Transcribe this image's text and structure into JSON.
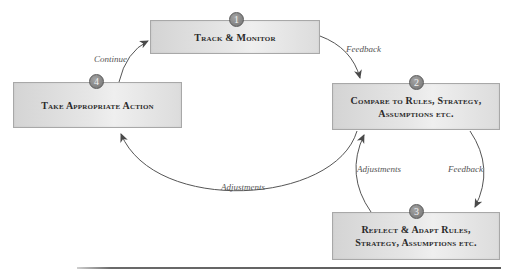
{
  "diagram": {
    "type": "cycle",
    "nodes": [
      {
        "id": 1,
        "number": "1",
        "label": "Track & Monitor"
      },
      {
        "id": 2,
        "number": "2",
        "label": "Compare to Rules, Strategy, Assumptions etc."
      },
      {
        "id": 3,
        "number": "3",
        "label": "Reflect & Adapt Rules, Strategy, Assumptions etc."
      },
      {
        "id": 4,
        "number": "4",
        "label": "Take Appropriate Action"
      }
    ],
    "edges": [
      {
        "from": 1,
        "to": 2,
        "label": "Feedback"
      },
      {
        "from": 2,
        "to": 3,
        "label": "Feedback"
      },
      {
        "from": 3,
        "to": 2,
        "label": "Adjustments"
      },
      {
        "from": 2,
        "to": 4,
        "label": "Adjustments"
      },
      {
        "from": 4,
        "to": 1,
        "label": "Continue"
      }
    ]
  },
  "colors": {
    "box_fill": "#e0e0e0",
    "box_border": "#a8a8a8",
    "badge_fill": "#8a8a8a",
    "arrow": "#555555",
    "text": "#2a2a2a"
  }
}
